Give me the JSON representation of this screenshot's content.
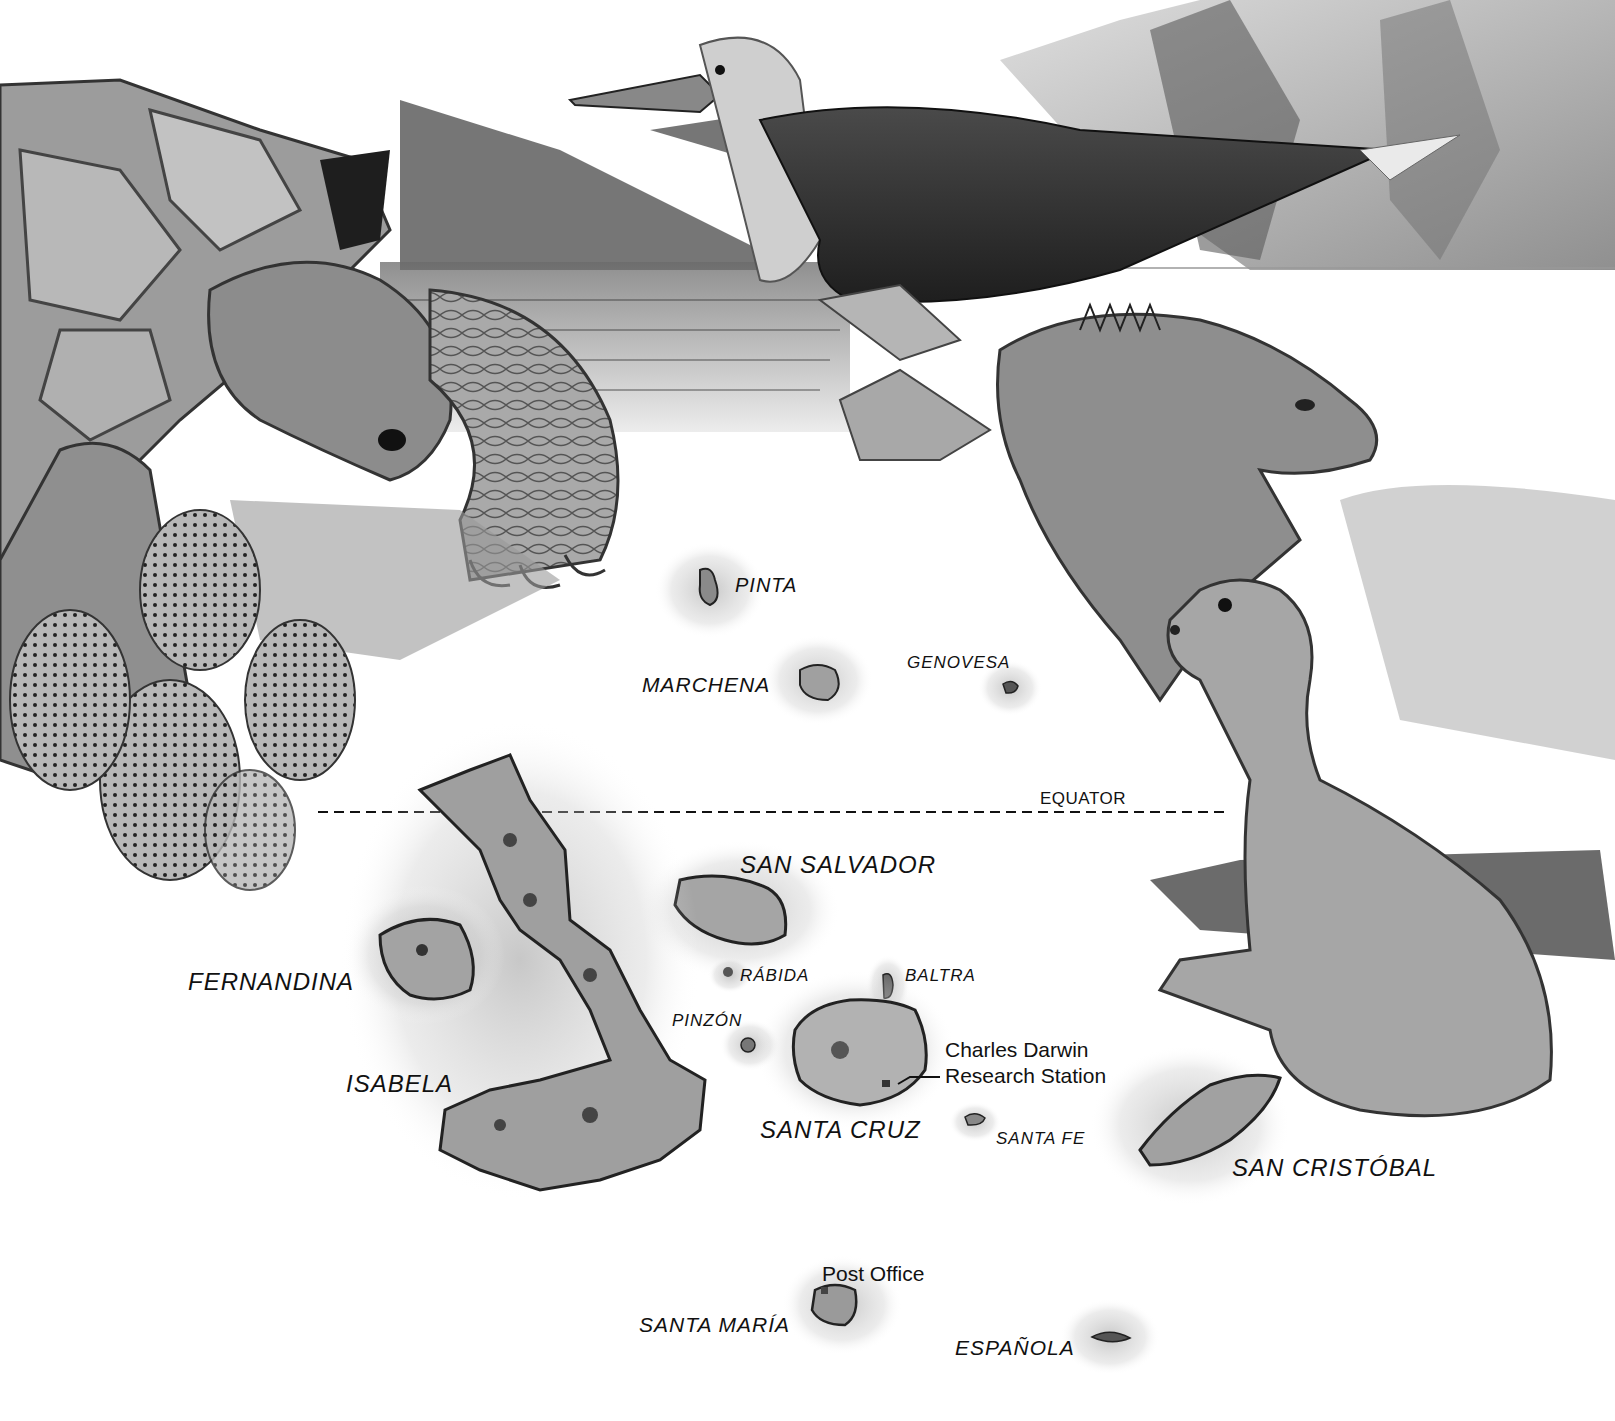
{
  "map": {
    "subject": "Galápagos Islands",
    "colors": {
      "ink": "#111111",
      "paper": "#ffffff",
      "shade": "#8a8a8a"
    },
    "equator": {
      "label": "EQUATOR"
    },
    "islands": {
      "pinta": "PINTA",
      "marchena": "MARCHENA",
      "genovesa": "GENOVESA",
      "san_salvador": "SAN SALVADOR",
      "fernandina": "FERNANDINA",
      "isabela": "ISABELA",
      "rabida": "RÁBIDA",
      "baltra": "BALTRA",
      "pinzon": "PINZÓN",
      "santa_cruz": "SANTA CRUZ",
      "santa_fe": "SANTA FE",
      "san_cristobal": "SAN CRISTÓBAL",
      "santa_maria": "SANTA MARÍA",
      "espanola": "ESPAÑOLA"
    },
    "landmarks": {
      "research_station_line1": "Charles Darwin",
      "research_station_line2": "Research Station",
      "post_office": "Post Office"
    },
    "illustrations": [
      "giant-tortoise",
      "prickly-pear-cactus",
      "blue-footed-booby",
      "land-iguana",
      "sea-lion",
      "volcanic-cliffs",
      "sea"
    ]
  }
}
